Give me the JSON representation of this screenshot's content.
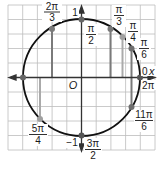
{
  "diagram": {
    "grid": {
      "cells": 10,
      "color": "#b8b8b8"
    },
    "axes": {
      "x_label": "x",
      "origin_label": "O",
      "y_top_value": "1",
      "y_bottom_value": "−1"
    },
    "colors": {
      "circle": "#111111",
      "axis": "#333333",
      "point_dark": "#6e6e6e",
      "point_light": "#9c9c9c",
      "drop_line_dark": "#7a7a7a",
      "drop_line_light": "#aaaaaa"
    },
    "angles": [
      {
        "id": "2pi-3",
        "num": "2π",
        "den": "3"
      },
      {
        "id": "pi-2",
        "num": "π",
        "den": "2"
      },
      {
        "id": "pi-3",
        "num": "π",
        "den": "3"
      },
      {
        "id": "pi-4",
        "num": "π",
        "den": "4"
      },
      {
        "id": "pi-6",
        "num": "π",
        "den": "6"
      },
      {
        "id": "zero",
        "text": "0"
      },
      {
        "id": "two-pi",
        "text": "2π"
      },
      {
        "id": "11pi-6",
        "num": "11π",
        "den": "6"
      },
      {
        "id": "3pi-2",
        "num": "3π",
        "den": "2"
      },
      {
        "id": "5pi-4",
        "num": "5π",
        "den": "4"
      }
    ]
  }
}
